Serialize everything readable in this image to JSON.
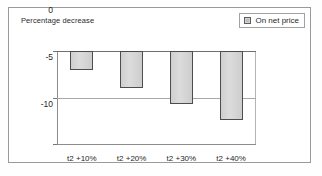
{
  "chart_data": {
    "type": "bar",
    "title": "Percentage decrease",
    "xlabel": "",
    "ylabel": "Percentage decrease",
    "categories": [
      "t2 +10%",
      "t2 +20%",
      "t2 +30%",
      "t2 +40%"
    ],
    "series": [
      {
        "name": "On net price",
        "values": [
          -2.0,
          -3.9,
          -5.6,
          -7.3
        ]
      }
    ],
    "ylim": [
      -10,
      0
    ],
    "yticks": [
      0,
      -5,
      -10
    ],
    "ytick_labels": [
      "0",
      "-5",
      "-10"
    ],
    "grid": true,
    "legend_position": "top-right",
    "bar_fill_color": "#d4d4d4",
    "bar_border_color": "#4d4d4d"
  },
  "legend": {
    "label": "On net price"
  },
  "axis": {
    "title": "Percentage decrease"
  }
}
